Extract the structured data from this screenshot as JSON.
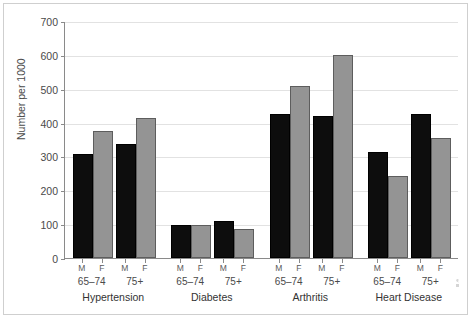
{
  "chart_data": {
    "type": "bar",
    "title": "",
    "subtitle": "",
    "xlabel": "",
    "ylabel": "Number per 1000",
    "ylim": [
      0,
      700
    ],
    "ytick_labels": [
      "0",
      "100",
      "200",
      "300",
      "400",
      "500",
      "600",
      "700"
    ],
    "ytick_values": [
      0,
      100,
      200,
      300,
      400,
      500,
      600,
      700
    ],
    "grid": "horizontal",
    "legend_position": "none",
    "sex_labels": [
      "M",
      "F"
    ],
    "age_labels": [
      "65–74",
      "75+"
    ],
    "categories": [
      "Hypertension",
      "Diabetes",
      "Arthritis",
      "Heart Disease"
    ],
    "series": [
      {
        "name": "M 65–74",
        "color": "#0d0d0d",
        "values": [
          307,
          98,
          425,
          313
        ]
      },
      {
        "name": "F 65–74",
        "color": "#949494",
        "values": [
          375,
          97,
          508,
          242
        ]
      },
      {
        "name": "M 75+",
        "color": "#0d0d0d",
        "values": [
          337,
          110,
          419,
          425
        ]
      },
      {
        "name": "F 75+",
        "color": "#949494",
        "values": [
          415,
          85,
          600,
          353
        ]
      }
    ],
    "groups": [
      {
        "condition": "Hypertension",
        "bars": [
          {
            "age": "65–74",
            "sex": "M",
            "value": 307
          },
          {
            "age": "65–74",
            "sex": "F",
            "value": 375
          },
          {
            "age": "75+",
            "sex": "M",
            "value": 337
          },
          {
            "age": "75+",
            "sex": "F",
            "value": 415
          }
        ]
      },
      {
        "condition": "Diabetes",
        "bars": [
          {
            "age": "65–74",
            "sex": "M",
            "value": 98
          },
          {
            "age": "65–74",
            "sex": "F",
            "value": 97
          },
          {
            "age": "75+",
            "sex": "M",
            "value": 110
          },
          {
            "age": "75+",
            "sex": "F",
            "value": 85
          }
        ]
      },
      {
        "condition": "Arthritis",
        "bars": [
          {
            "age": "65–74",
            "sex": "M",
            "value": 425
          },
          {
            "age": "65–74",
            "sex": "F",
            "value": 508
          },
          {
            "age": "75+",
            "sex": "M",
            "value": 419
          },
          {
            "age": "75+",
            "sex": "F",
            "value": 600
          }
        ]
      },
      {
        "condition": "Heart Disease",
        "bars": [
          {
            "age": "65–74",
            "sex": "M",
            "value": 313
          },
          {
            "age": "65–74",
            "sex": "F",
            "value": 242
          },
          {
            "age": "75+",
            "sex": "M",
            "value": 425
          },
          {
            "age": "75+",
            "sex": "F",
            "value": 353
          }
        ]
      }
    ]
  }
}
